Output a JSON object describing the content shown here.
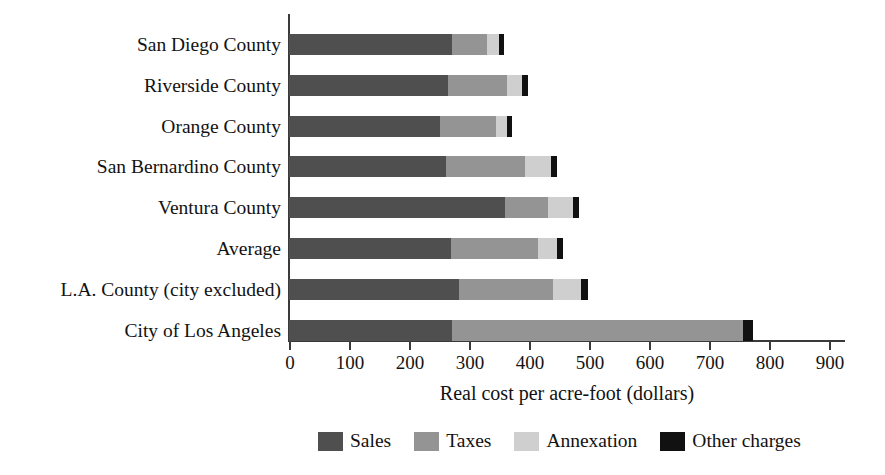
{
  "chart_data": {
    "type": "bar",
    "orientation": "horizontal",
    "stacked": true,
    "title": "",
    "xlabel": "Real cost per acre-foot (dollars)",
    "ylabel": "",
    "xlim": [
      0,
      900
    ],
    "xticks": [
      0,
      100,
      200,
      300,
      400,
      500,
      600,
      700,
      800,
      900
    ],
    "grid": false,
    "legend_position": "bottom",
    "categories": [
      "San Diego County",
      "Riverside County",
      "Orange County",
      "San Bernardino County",
      "Ventura County",
      "Average",
      "L.A. County (city excluded)",
      "City of Los Angeles"
    ],
    "series": [
      {
        "name": "Sales",
        "color": "#4f4f4f",
        "values": [
          272,
          265,
          252,
          261,
          360,
          270,
          283,
          272
        ]
      },
      {
        "name": "Taxes",
        "color": "#949494",
        "values": [
          58,
          98,
          93,
          133,
          72,
          145,
          157,
          485
        ]
      },
      {
        "name": "Annexation",
        "color": "#cfcfcf",
        "values": [
          20,
          25,
          18,
          42,
          42,
          32,
          47,
          0
        ]
      },
      {
        "name": "Other charges",
        "color": "#111111",
        "values": [
          8,
          10,
          8,
          10,
          10,
          9,
          12,
          16
        ]
      }
    ],
    "totals": [
      358,
      398,
      371,
      446,
      484,
      456,
      499,
      773
    ]
  },
  "axis": {
    "x_title": "Real cost per acre-foot (dollars)",
    "tick_labels": [
      "0",
      "100",
      "200",
      "300",
      "400",
      "500",
      "600",
      "700",
      "800",
      "900"
    ]
  },
  "legend": {
    "items": [
      {
        "label": "Sales",
        "color": "#4f4f4f"
      },
      {
        "label": "Taxes",
        "color": "#949494"
      },
      {
        "label": "Annexation",
        "color": "#cfcfcf"
      },
      {
        "label": "Other charges",
        "color": "#111111"
      }
    ]
  }
}
